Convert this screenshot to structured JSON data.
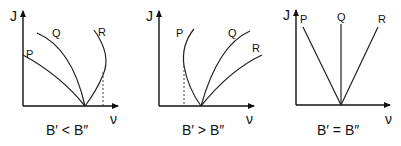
{
  "panels": [
    {
      "id": "b-lt",
      "y_axis_label": "J",
      "x_axis_label": "ν",
      "caption": "B′ < B″",
      "branches": [
        "P",
        "Q",
        "R"
      ],
      "note": "R branch forms band head (turns back toward lower ν)"
    },
    {
      "id": "b-gt",
      "y_axis_label": "J",
      "x_axis_label": "ν",
      "caption": "B′ > B″",
      "branches": [
        "P",
        "Q",
        "R"
      ],
      "note": "P branch forms band head (turns back toward higher ν)"
    },
    {
      "id": "b-eq",
      "y_axis_label": "J",
      "x_axis_label": "ν",
      "caption": "B′ = B″",
      "branches": [
        "P",
        "Q",
        "R"
      ],
      "note": "Straight-line branches, no band head"
    }
  ]
}
